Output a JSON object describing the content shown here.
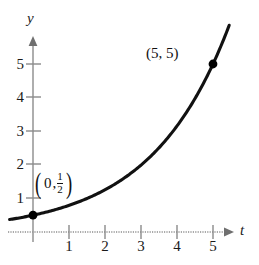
{
  "chart_data": {
    "type": "line",
    "title": "",
    "xlabel": "t",
    "ylabel": "y",
    "xlim": [
      -0.7,
      5.9
    ],
    "ylim": [
      -0.5,
      5.9
    ],
    "xticks": [
      1,
      2,
      3,
      4,
      5
    ],
    "yticks": [
      1,
      2,
      3,
      4,
      5
    ],
    "xtick_labels": [
      "1",
      "2",
      "3",
      "4",
      "5"
    ],
    "ytick_labels": [
      "1",
      "2",
      "3",
      "4",
      "5"
    ],
    "grid": false,
    "legend": "none",
    "curve": {
      "name": "exponential-growth",
      "equation": "y = 0.5 * e^(0.4605 t)",
      "x": [
        -0.7,
        0,
        0.5,
        1,
        1.5,
        2,
        2.5,
        3,
        3.5,
        4,
        4.5,
        5,
        5.4
      ],
      "y": [
        0.36,
        0.5,
        0.63,
        0.79,
        1.0,
        1.26,
        1.58,
        1.99,
        2.5,
        3.15,
        3.97,
        5.0,
        6.0
      ]
    },
    "points": [
      {
        "name": "point-origin-half",
        "x": 0,
        "y": 0.5,
        "label": "(0, 1/2)"
      },
      {
        "name": "point-five-five",
        "x": 5,
        "y": 5,
        "label": "(5, 5)"
      }
    ],
    "annotations": [
      {
        "name": "label-point-0-half",
        "open_paren": "(",
        "x_value": "0",
        "comma": ",",
        "frac_num": "1",
        "frac_den": "2",
        "close_paren": ")"
      },
      {
        "name": "label-point-5-5",
        "text": "(5, 5)"
      }
    ]
  },
  "colors": {
    "curve": "#111111",
    "axis": "#8a8a8a",
    "text": "#1a1a1a",
    "background": "#ffffff",
    "point": "#000000"
  }
}
